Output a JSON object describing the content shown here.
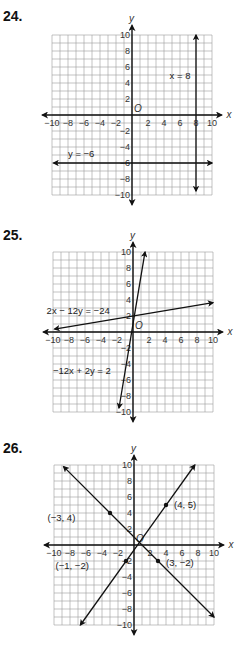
{
  "problems": [
    {
      "number": "24.",
      "top": 0,
      "origin": [
        132,
        115
      ]
    },
    {
      "number": "25.",
      "top": 0,
      "origin": [
        133,
        332
      ]
    },
    {
      "number": "26.",
      "top": 0,
      "origin": [
        134,
        545
      ]
    }
  ],
  "chart_data": [
    {
      "type": "line",
      "title": "24.",
      "xlabel": "x",
      "ylabel": "y",
      "xlim": [
        -10,
        10
      ],
      "ylim": [
        -10,
        10
      ],
      "grid": true,
      "origin_label": "O",
      "x_ticks": [
        "-10",
        "-8",
        "-6",
        "-4",
        "-2",
        "2",
        "4",
        "6",
        "8",
        "10"
      ],
      "y_ticks": [
        "10",
        "8",
        "6",
        "4",
        "2",
        "-2",
        "-4",
        "-6",
        "-8",
        "-10"
      ],
      "series": [
        {
          "name": "x = 8",
          "kind": "vertical",
          "x": 8,
          "from": [
            8,
            -9.5
          ],
          "to": [
            8,
            10
          ],
          "arrows": "both",
          "label_pos": [
            4.7,
            4.5
          ]
        },
        {
          "name": "y = -6",
          "kind": "horizontal",
          "y": -6,
          "from": [
            -9.8,
            -6
          ],
          "to": [
            10,
            -6
          ],
          "arrows": "both",
          "label_pos": [
            -8,
            -5.2
          ]
        }
      ],
      "points": []
    },
    {
      "type": "line",
      "title": "25.",
      "xlabel": "x",
      "ylabel": "y",
      "xlim": [
        -10,
        10
      ],
      "ylim": [
        -10,
        10
      ],
      "grid": true,
      "origin_label": "O",
      "x_ticks": [
        "-10",
        "-8",
        "-6",
        "-4",
        "-2",
        "2",
        "4",
        "6",
        "8",
        "10"
      ],
      "y_ticks": [
        "10",
        "8",
        "6",
        "4",
        "2",
        "-2",
        "-4",
        "-6",
        "-8",
        "-10"
      ],
      "series": [
        {
          "name": "2x - 12y = -24",
          "equation": "y = x/6 + 2",
          "from": [
            -9.8,
            0.37
          ],
          "to": [
            10,
            3.67
          ],
          "arrows": "both",
          "label_pos": [
            -10.8,
            2.3
          ]
        },
        {
          "name": "-12x + 2y = 2",
          "equation": "y = 6x + 1",
          "from": [
            -1.75,
            -9.5
          ],
          "to": [
            1.5,
            10
          ],
          "arrows": "both",
          "label_pos": [
            -10,
            -5.3
          ]
        }
      ],
      "points": []
    },
    {
      "type": "line",
      "title": "26.",
      "xlabel": "x",
      "ylabel": "y",
      "xlim": [
        -10,
        10
      ],
      "ylim": [
        -10,
        10
      ],
      "grid": true,
      "origin_label": "O",
      "x_ticks": [
        "-10",
        "-8",
        "-6",
        "-4",
        "-2",
        "2",
        "4",
        "6",
        "8",
        "10"
      ],
      "y_ticks": [
        "10",
        "8",
        "6",
        "4",
        "2",
        "-2",
        "-4",
        "-6",
        "-8",
        "-10"
      ],
      "series": [
        {
          "name": "line through (-1, -2) and (4, 5)",
          "equation": "y = 1.4x - 0.6",
          "from": [
            -6.7,
            -10
          ],
          "to": [
            7.6,
            10
          ],
          "arrows": "both"
        },
        {
          "name": "line through (-3, 4) and (3, -2)",
          "equation": "y = -x + 1",
          "from": [
            -8.8,
            9.8
          ],
          "to": [
            10,
            -9
          ],
          "arrows": "both"
        }
      ],
      "points": [
        {
          "label": "(-3, 4)",
          "x": -3,
          "y": 4,
          "label_pos": [
            -10.8,
            3
          ]
        },
        {
          "label": "(4, 5)",
          "x": 4,
          "y": 5,
          "label_pos": [
            5,
            4.6
          ]
        },
        {
          "label": "(-1, -2)",
          "x": -1,
          "y": -2,
          "label_pos": [
            -9.8,
            -3
          ]
        },
        {
          "label": "(3, -2)",
          "x": 3,
          "y": -2,
          "label_pos": [
            4,
            -2.6
          ]
        }
      ]
    }
  ]
}
